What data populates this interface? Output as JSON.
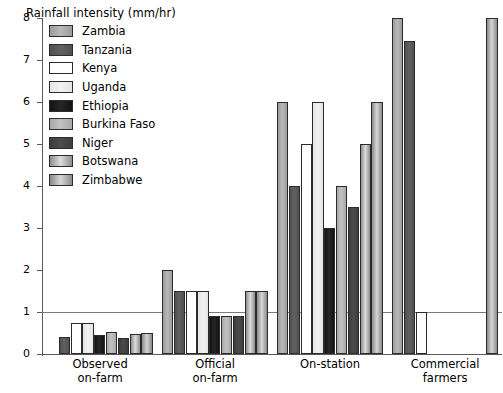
{
  "chart_data": {
    "type": "bar",
    "title": "",
    "ylabel": "Rainfall intensity (mm/hr)",
    "xlabel": "",
    "ylim": [
      0,
      8
    ],
    "yticks": [
      0,
      1,
      2,
      3,
      4,
      5,
      6,
      7,
      8
    ],
    "ytick_labels": [
      "0",
      "1",
      "2",
      "3",
      "4",
      "5",
      "6",
      "7",
      "8"
    ],
    "grid": "single horizontal reference line at y = 1",
    "gridlines": [
      1
    ],
    "legend_position": "upper-left inside plot",
    "categories": [
      "Observed on-farm",
      "Official on-farm",
      "On-station",
      "Commercial farmers"
    ],
    "category_lines": [
      [
        "Observed",
        "on-farm"
      ],
      [
        "Official",
        "on-farm"
      ],
      [
        "On-station",
        ""
      ],
      [
        "Commercial",
        "farmers"
      ]
    ],
    "series": [
      {
        "name": "Zambia",
        "color": "#9c9c9c",
        "color2": "#b8b8b8",
        "values": [
          0.0,
          2.0,
          6.0,
          8.0
        ]
      },
      {
        "name": "Tanzania",
        "color": "#505050",
        "color2": "#616161",
        "values": [
          0.4,
          1.5,
          4.0,
          7.45
        ]
      },
      {
        "name": "Kenya",
        "color": "#ffffff",
        "color2": "#ffffff",
        "values": [
          0.75,
          1.5,
          5.0,
          1.0
        ]
      },
      {
        "name": "Uganda",
        "color": "#e4e4e4",
        "color2": "#f2f2f2",
        "values": [
          0.75,
          1.5,
          6.0,
          0.0
        ]
      },
      {
        "name": "Ethiopia",
        "color": "#131313",
        "color2": "#262626",
        "values": [
          0.45,
          0.9,
          3.0,
          0.0
        ]
      },
      {
        "name": "Burkina Faso",
        "color": "#a8a8a8",
        "color2": "#c2c2c2",
        "values": [
          0.52,
          0.9,
          4.0,
          0.0
        ]
      },
      {
        "name": "Niger",
        "color": "#3c3c3c",
        "color2": "#4c4c4c",
        "values": [
          0.37,
          0.9,
          3.5,
          0.0
        ]
      },
      {
        "name": "Botswana",
        "color": "#8e8e8e",
        "color2": "#dcdcdc",
        "values": [
          0.48,
          1.5,
          5.0,
          0.0
        ]
      },
      {
        "name": "Zimbabwe",
        "color": "#8a8a8a",
        "color2": "#d6d6d6",
        "values": [
          0.5,
          1.5,
          6.0,
          8.0
        ]
      }
    ]
  }
}
